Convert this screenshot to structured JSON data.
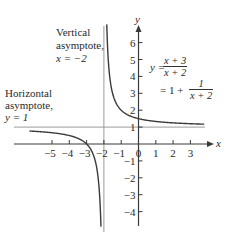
{
  "chart_data": {
    "type": "line",
    "title": "",
    "function": "y = (x + 3)/(x + 2) = 1 + 1/(x + 2)",
    "xlabel": "x",
    "ylabel": "y",
    "xlim": [
      -6.3,
      3.8
    ],
    "ylim": [
      -4.8,
      6.8
    ],
    "x_ticks": [
      -5,
      -4,
      -3,
      -2,
      -1,
      0,
      1,
      2,
      3
    ],
    "x_tick_labels": [
      "−5",
      "−4",
      "−3",
      "−2",
      "−1",
      "0",
      "1",
      "2",
      "3"
    ],
    "y_ticks": [
      -4,
      -3,
      -2,
      -1,
      1,
      2,
      3,
      4,
      5,
      6
    ],
    "y_tick_labels": [
      "−4",
      "−3",
      "−2",
      "−1",
      "1",
      "2",
      "3",
      "4",
      "5",
      "6"
    ],
    "grid": false,
    "asymptotes": {
      "vertical": {
        "x": -2,
        "label": "Vertical asymptote, x = −2"
      },
      "horizontal": {
        "y": 1,
        "label": "Horizontal asymptote, y = 1"
      }
    },
    "series": [
      {
        "name": "left branch",
        "x": [
          -6.3,
          -5,
          -4,
          -3.5,
          -3,
          -2.5,
          -2.2,
          -2.15
        ],
        "y": [
          0.77,
          0.67,
          0.5,
          0.33,
          0,
          -1,
          -4,
          -5.67
        ]
      },
      {
        "name": "right branch",
        "x": [
          -1.85,
          -1.8,
          -1.5,
          -1,
          0,
          1,
          2,
          3,
          3.8
        ],
        "y": [
          7.67,
          6,
          3,
          2,
          1.5,
          1.33,
          1.25,
          1.2,
          1.17
        ]
      }
    ]
  },
  "labels": {
    "y_axis": "y",
    "x_axis": "x",
    "vertical_asymptote": [
      "Vertical",
      "asymptote,",
      "x = −2"
    ],
    "horizontal_asymptote": [
      "Horizontal",
      "asymptote,",
      "y = 1"
    ],
    "equation": {
      "lhs": "y =",
      "frac1_num": "x + 3",
      "frac1_den": "x + 2",
      "line2_prefix": "= 1 +",
      "frac2_num": "1",
      "frac2_den": "x + 2"
    }
  },
  "colors": {
    "curve": "#3a3a3a",
    "axis": "#3a3a3a",
    "asymptote": "#9a9a9a"
  }
}
